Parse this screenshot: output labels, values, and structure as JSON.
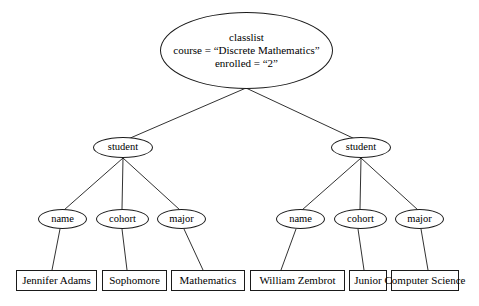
{
  "diagram": {
    "type": "xml-document-tree",
    "root": {
      "id": "root",
      "shape": "ellipse",
      "label_lines": [
        "classlist",
        "course = “Discrete Mathematics”",
        "enrolled = “2”"
      ],
      "element_name": "classlist",
      "attributes": [
        {
          "name": "course",
          "value": "“Discrete Mathematics”"
        },
        {
          "name": "enrolled",
          "value": "“2”"
        }
      ]
    },
    "students": [
      {
        "id": "student-1",
        "shape": "ellipse",
        "label": "student",
        "fields": [
          {
            "id": "name-1",
            "label": "name",
            "value": "Jennifer Adams"
          },
          {
            "id": "cohort-1",
            "label": "cohort",
            "value": "Sophomore"
          },
          {
            "id": "major-1",
            "label": "major",
            "value": "Mathematics"
          }
        ]
      },
      {
        "id": "student-2",
        "shape": "ellipse",
        "label": "student",
        "fields": [
          {
            "id": "name-2",
            "label": "name",
            "value": "William Zembrot"
          },
          {
            "id": "cohort-2",
            "label": "cohort",
            "value": "Junior"
          },
          {
            "id": "major-2",
            "label": "major",
            "value": "Computer Science"
          }
        ]
      }
    ],
    "colors": {
      "stroke": "#1a1a1a",
      "text": "#000000",
      "background": "#ffffff"
    },
    "edges": [
      {
        "from": "root",
        "to": "student-1"
      },
      {
        "from": "root",
        "to": "student-2"
      },
      {
        "from": "student-1",
        "to": "name-1"
      },
      {
        "from": "student-1",
        "to": "cohort-1"
      },
      {
        "from": "student-1",
        "to": "major-1"
      },
      {
        "from": "student-2",
        "to": "name-2"
      },
      {
        "from": "student-2",
        "to": "cohort-2"
      },
      {
        "from": "student-2",
        "to": "major-2"
      },
      {
        "from": "name-1",
        "to": "value-name-1"
      },
      {
        "from": "cohort-1",
        "to": "value-cohort-1"
      },
      {
        "from": "major-1",
        "to": "value-major-1"
      },
      {
        "from": "name-2",
        "to": "value-name-2"
      },
      {
        "from": "cohort-2",
        "to": "value-cohort-2"
      },
      {
        "from": "major-2",
        "to": "value-major-2"
      }
    ]
  }
}
